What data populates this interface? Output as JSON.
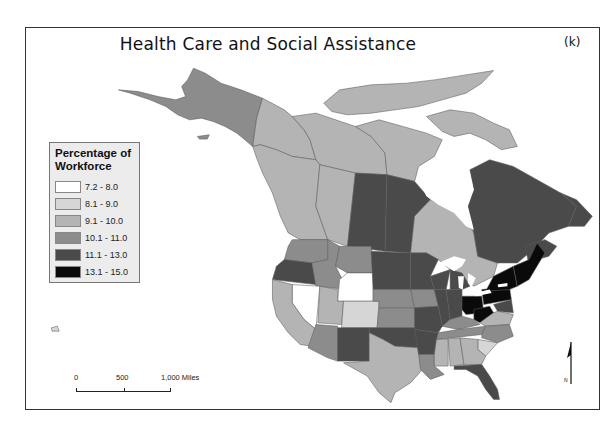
{
  "map": {
    "title": "Health Care and Social Assistance",
    "panel_label": "(k)",
    "legend": {
      "title": "Percentage of Workforce",
      "items": [
        {
          "label": "7.2 - 8.0",
          "color": "#ffffff"
        },
        {
          "label": "8.1 - 9.0",
          "color": "#d6d6d6"
        },
        {
          "label": "9.1 - 10.0",
          "color": "#b4b4b4"
        },
        {
          "label": "10.1 - 11.0",
          "color": "#8c8c8c"
        },
        {
          "label": "11.1 - 13.0",
          "color": "#4a4a4a"
        },
        {
          "label": "13.1 - 15.0",
          "color": "#0a0a0a"
        }
      ]
    },
    "scale_bar": {
      "ticks": [
        "0",
        "500",
        "1,000 Miles"
      ]
    },
    "north_arrow": {
      "label": "N"
    },
    "regions": {
      "Alaska": "10.1 - 11.0",
      "Yukon": "9.1 - 10.0",
      "Northwest Territories": "9.1 - 10.0",
      "Nunavut": "9.1 - 10.0",
      "British Columbia": "9.1 - 10.0",
      "Alberta": "9.1 - 10.0",
      "Saskatchewan": "11.1 - 13.0",
      "Manitoba": "11.1 - 13.0",
      "Ontario": "9.1 - 10.0",
      "Quebec": "11.1 - 13.0",
      "Atlantic Canada": "11.1 - 13.0",
      "Washington": "10.1 - 11.0",
      "Oregon": "11.1 - 13.0",
      "California": "9.1 - 10.0",
      "Nevada": "7.2 - 8.0",
      "Idaho": "10.1 - 11.0",
      "Montana": "10.1 - 11.0",
      "Wyoming": "7.2 - 8.0",
      "Utah": "9.1 - 10.0",
      "Colorado": "8.1 - 9.0",
      "Arizona": "10.1 - 11.0",
      "New Mexico": "11.1 - 13.0",
      "North Dakota": "11.1 - 13.0",
      "South Dakota": "11.1 - 13.0",
      "Nebraska": "10.1 - 11.0",
      "Kansas": "10.1 - 11.0",
      "Oklahoma": "11.1 - 13.0",
      "Texas": "9.1 - 10.0",
      "Minnesota": "11.1 - 13.0",
      "Iowa": "10.1 - 11.0",
      "Missouri": "11.1 - 13.0",
      "Arkansas": "11.1 - 13.0",
      "Louisiana": "10.1 - 11.0",
      "Wisconsin": "11.1 - 13.0",
      "Illinois": "11.1 - 13.0",
      "Michigan": "11.1 - 13.0",
      "Indiana": "11.1 - 13.0",
      "Ohio": "13.1 - 15.0",
      "Kentucky": "10.1 - 11.0",
      "Tennessee": "10.1 - 11.0",
      "Mississippi": "9.1 - 10.0",
      "Alabama": "9.1 - 10.0",
      "Georgia": "9.1 - 10.0",
      "Florida": "11.1 - 13.0",
      "South Carolina": "8.1 - 9.0",
      "North Carolina": "10.1 - 11.0",
      "Virginia": "9.1 - 10.0",
      "West Virginia": "13.1 - 15.0",
      "Pennsylvania": "13.1 - 15.0",
      "New York": "13.1 - 15.0",
      "New England": "13.1 - 15.0",
      "Maryland": "11.1 - 13.0",
      "Hawaii": "8.1 - 9.0"
    }
  }
}
